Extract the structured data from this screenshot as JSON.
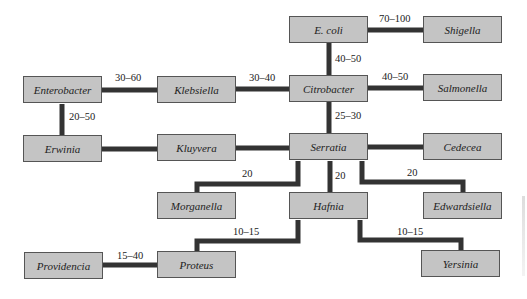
{
  "diagram": {
    "type": "phylogenetic-relationship-network",
    "edge_color": "#333333",
    "node_fill": "#c4c4c4",
    "nodes": [
      {
        "id": "ecoli",
        "label": "E. coli"
      },
      {
        "id": "shigella",
        "label": "Shigella"
      },
      {
        "id": "enterobacter",
        "label": "Enterobacter"
      },
      {
        "id": "klebsiella",
        "label": "Klebsiella"
      },
      {
        "id": "citrobacter",
        "label": "Citrobacter"
      },
      {
        "id": "salmonella",
        "label": "Salmonella"
      },
      {
        "id": "erwinia",
        "label": "Erwinia"
      },
      {
        "id": "kluyvera",
        "label": "Kluyvera"
      },
      {
        "id": "serratia",
        "label": "Serratia"
      },
      {
        "id": "cedecea",
        "label": "Cedecea"
      },
      {
        "id": "morganella",
        "label": "Morganella"
      },
      {
        "id": "hafnia",
        "label": "Hafnia"
      },
      {
        "id": "edwardsiella",
        "label": "Edwardsiella"
      },
      {
        "id": "providencia",
        "label": "Providencia"
      },
      {
        "id": "proteus",
        "label": "Proteus"
      },
      {
        "id": "yersinia",
        "label": "Yersinia"
      }
    ],
    "edges": [
      {
        "from": "ecoli",
        "to": "shigella",
        "label": "70–100"
      },
      {
        "from": "ecoli",
        "to": "citrobacter",
        "label": "40–50"
      },
      {
        "from": "enterobacter",
        "to": "klebsiella",
        "label": "30–60"
      },
      {
        "from": "klebsiella",
        "to": "citrobacter",
        "label": "30–40"
      },
      {
        "from": "citrobacter",
        "to": "salmonella",
        "label": "40–50"
      },
      {
        "from": "enterobacter",
        "to": "erwinia",
        "label": "20–50"
      },
      {
        "from": "citrobacter",
        "to": "serratia",
        "label": "25–30"
      },
      {
        "from": "erwinia",
        "to": "kluyvera",
        "label": ""
      },
      {
        "from": "kluyvera",
        "to": "serratia",
        "label": ""
      },
      {
        "from": "serratia",
        "to": "cedecea",
        "label": ""
      },
      {
        "from": "serratia",
        "to": "morganella",
        "label": "20"
      },
      {
        "from": "serratia",
        "to": "hafnia",
        "label": "20"
      },
      {
        "from": "serratia",
        "to": "edwardsiella",
        "label": "20"
      },
      {
        "from": "hafnia",
        "to": "proteus",
        "label": "10–15"
      },
      {
        "from": "hafnia",
        "to": "yersinia",
        "label": "10–15"
      },
      {
        "from": "providencia",
        "to": "proteus",
        "label": "15–40"
      }
    ]
  }
}
